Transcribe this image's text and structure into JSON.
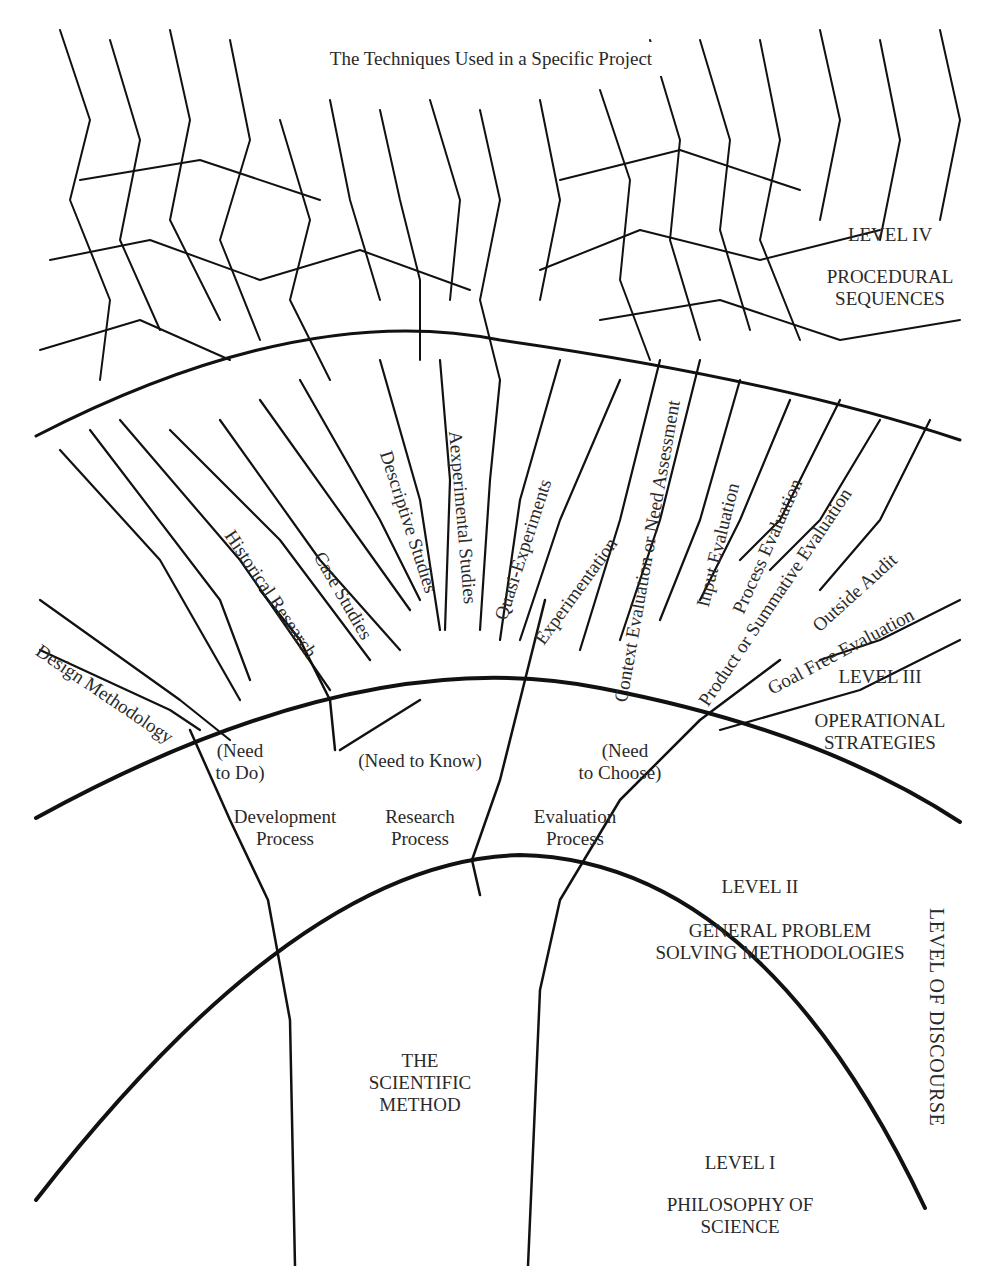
{
  "title": "The Techniques Used in a Specific Project",
  "axis_label": "LEVEL OF DISCOURSE",
  "levels": [
    {
      "level": "LEVEL IV",
      "name_lines": [
        "PROCEDURAL",
        "SEQUENCES"
      ]
    },
    {
      "level": "LEVEL III",
      "name_lines": [
        "OPERATIONAL",
        "STRATEGIES"
      ]
    },
    {
      "level": "LEVEL II",
      "name_lines": [
        "GENERAL PROBLEM",
        "SOLVING METHODOLOGIES"
      ]
    },
    {
      "level": "LEVEL I",
      "name_lines": [
        "PHILOSOPHY OF",
        "SCIENCE"
      ]
    }
  ],
  "core": [
    "THE",
    "SCIENTIFIC",
    "METHOD"
  ],
  "processes": [
    {
      "need": [
        "(Need",
        "to Do)"
      ],
      "name": [
        "Development",
        "Process"
      ]
    },
    {
      "need": [
        "(Need to Know)"
      ],
      "name": [
        "Research",
        "Process"
      ]
    },
    {
      "need": [
        "(Need",
        "to Choose)"
      ],
      "name": [
        "Evaluation",
        "Process"
      ]
    }
  ],
  "strategies": [
    "Design Methodology",
    "Historical Research",
    "Case Studies",
    "Descriptive Studies",
    "Aexperimental Studies",
    "Quasi-Experiments",
    "Experimentation",
    "Context Evaluation or Need Assessment",
    "Input Evaluation",
    "Process Evaluation",
    "Product or Summative Evaluation",
    "Outside Audit",
    "Goal Free Evaluation"
  ]
}
